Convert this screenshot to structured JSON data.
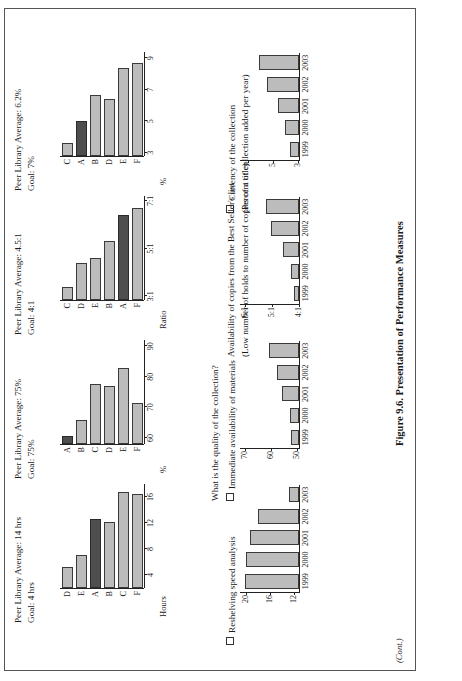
{
  "figure": {
    "caption": "Figure 9.6. Presentation of Performance Measures",
    "continued": "(Cont.)"
  },
  "sections": [
    {
      "id": "reshelving",
      "label": "Reshelving speed analysis",
      "sublabel": "",
      "peer_average": "Peer Library Average: 14 hrs",
      "goal": "Goal: 4 hrs",
      "trend": {
        "type": "bar",
        "title": "Reshelving speed analysis",
        "xlabel": "",
        "ylabel": "",
        "categories": [
          "1999",
          "2000",
          "2001",
          "2002",
          "2003"
        ],
        "values": [
          20.0,
          19.8,
          19.2,
          17.8,
          12.6
        ],
        "yticks": [
          "12",
          "16",
          "20"
        ],
        "ytickvals": [
          12,
          16,
          20
        ],
        "ylim": [
          11,
          21
        ]
      },
      "peers": {
        "type": "bar",
        "orientation": "horizontal",
        "categories": [
          "D",
          "E",
          "A",
          "B",
          "C",
          "F"
        ],
        "values": [
          5.2,
          7.0,
          12.6,
          12.2,
          16.8,
          16.4
        ],
        "highlight": "A",
        "xticks": [
          "4",
          "8",
          "12",
          "16"
        ],
        "xtickvals": [
          4,
          8,
          12,
          16
        ],
        "xlim": [
          2,
          18
        ],
        "axis_title": "Hours"
      }
    },
    {
      "id": "availability",
      "label": "Immediate availability of materials",
      "sublabel": "What is the quality of the collection?",
      "peer_average": "Peer Library Average: 75%",
      "goal": "Goal: 75%",
      "trend": {
        "type": "bar",
        "title": "Immediate availability of materials",
        "xlabel": "",
        "ylabel": "",
        "categories": [
          "1999",
          "2000",
          "2001",
          "2002",
          "2003"
        ],
        "values": [
          52.0,
          52.5,
          55.5,
          57.5,
          60.5
        ],
        "yticks": [
          "50",
          "60",
          "70"
        ],
        "ytickvals": [
          50,
          60,
          70
        ],
        "ylim": [
          49,
          72
        ]
      },
      "peers": {
        "type": "bar",
        "orientation": "horizontal",
        "categories": [
          "A",
          "B",
          "C",
          "D",
          "E",
          "F"
        ],
        "values": [
          60.5,
          66.0,
          77.5,
          77.0,
          83.0,
          71.5
        ],
        "highlight": "A",
        "xticks": [
          "60",
          "70",
          "80",
          "90"
        ],
        "xtickvals": [
          60,
          70,
          80,
          90
        ],
        "xlim": [
          58,
          92
        ],
        "axis_title": "%"
      }
    },
    {
      "id": "bestseller",
      "label": "Availability of copies from the Best Seller's list",
      "sublabel": "(Low number of holds to number of copies of a title)",
      "peer_average": "Peer Library Average: 4.5:1",
      "goal": "Goal: 4:1",
      "trend": {
        "type": "bar",
        "title": "Availability of copies from the Best Seller's list",
        "xlabel": "",
        "ylabel": "",
        "categories": [
          "1999",
          "2000",
          "2001",
          "2002",
          "2003"
        ],
        "values": [
          4.15,
          4.25,
          4.55,
          5.0,
          5.2
        ],
        "yticks": [
          "4:1",
          "5:1",
          "6:1"
        ],
        "ytickvals": [
          4,
          5,
          6
        ],
        "ylim": [
          3.95,
          6.2
        ]
      },
      "peers": {
        "type": "bar",
        "orientation": "horizontal",
        "categories": [
          "C",
          "D",
          "E",
          "B",
          "A",
          "F"
        ],
        "values": [
          3.4,
          4.4,
          4.6,
          5.3,
          6.4,
          6.7
        ],
        "highlight": "A",
        "xticks": [
          "3:1",
          "5:1",
          "7:1"
        ],
        "xtickvals": [
          3,
          5,
          7
        ],
        "xlim": [
          2.85,
          7.2
        ],
        "axis_title": "Ratio"
      }
    },
    {
      "id": "currency",
      "label": "Currency of the collection",
      "sublabel": "(Percent of collection added per year)",
      "peer_average": "Peer Library Average: 6.2%",
      "goal": "Goal: 7%",
      "trend": {
        "type": "bar",
        "title": "Currency of the collection",
        "xlabel": "",
        "ylabel": "",
        "categories": [
          "1999",
          "2000",
          "2001",
          "2002",
          "2003"
        ],
        "values": [
          3.5,
          3.9,
          4.5,
          5.4,
          6.0
        ],
        "yticks": [
          "3",
          "5",
          "7"
        ],
        "ytickvals": [
          3,
          5,
          7
        ],
        "ylim": [
          2.8,
          7.6
        ]
      },
      "peers": {
        "type": "bar",
        "orientation": "horizontal",
        "categories": [
          "C",
          "A",
          "B",
          "D",
          "E",
          "F"
        ],
        "values": [
          3.6,
          5.0,
          6.7,
          6.4,
          8.4,
          8.7
        ],
        "highlight": "A",
        "xticks": [
          "3",
          "5",
          "7",
          "9"
        ],
        "xtickvals": [
          3,
          5,
          7,
          9
        ],
        "xlim": [
          2.8,
          9.4
        ],
        "axis_title": "%"
      }
    }
  ],
  "colors": {
    "bar_fill": "#bcbcbc",
    "bar_highlight": "#4e4e4e",
    "bar_stroke": "#3a3a3a",
    "axis": "#222222",
    "border": "#555555"
  }
}
